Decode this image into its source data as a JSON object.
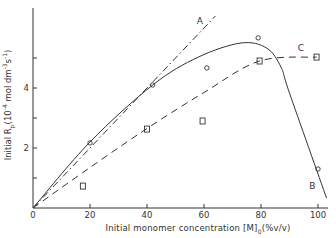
{
  "chart_data": {
    "type": "scatter",
    "title": "",
    "xlabel": "Initial monomer concentration [M]0(%v/v)",
    "ylabel": "Initial Rp(10^-4 mol dm^-3 s^-1)",
    "xlim": [
      0,
      104
    ],
    "ylim": [
      0,
      6.7
    ],
    "x_ticks": [
      0,
      20,
      40,
      60,
      80,
      100
    ],
    "x_tick_labels": [
      "0",
      "20",
      "40",
      "60",
      "80",
      "100"
    ],
    "y_ticks": [
      0,
      1,
      2,
      3,
      4,
      5
    ],
    "y_tick_labels": [
      "",
      "",
      "2",
      "",
      "4",
      ""
    ],
    "origin_label": "0",
    "grid": false,
    "legend": "none (curves labelled A, B, C inline)",
    "series": [
      {
        "name": "circles (experimental)",
        "marker": "circle",
        "x": [
          20,
          42,
          61,
          79,
          100
        ],
        "y": [
          2.17,
          4.1,
          4.67,
          5.67,
          1.3
        ]
      },
      {
        "name": "squares (experimental)",
        "marker": "square",
        "x": [
          17.5,
          40,
          59.5,
          79.5,
          99.5
        ],
        "y": [
          0.73,
          2.63,
          2.9,
          4.9,
          5.03
        ]
      },
      {
        "name": "A",
        "style": "dash-dot line",
        "x": [
          0,
          64
        ],
        "y": [
          0,
          6.4
        ]
      },
      {
        "name": "B",
        "style": "solid curve",
        "x": [
          0,
          20,
          42,
          58,
          73,
          82,
          87,
          90,
          103
        ],
        "y": [
          0,
          2.2,
          4.1,
          5.03,
          5.5,
          5.33,
          4.7,
          3.83,
          0.33
        ]
      },
      {
        "name": "C",
        "style": "dashed curve",
        "x": [
          0,
          20,
          40,
          60,
          79.5,
          99.5
        ],
        "y": [
          0,
          1.35,
          2.65,
          3.85,
          4.9,
          5.03
        ]
      }
    ],
    "annotations": [
      {
        "text": "A",
        "x": 58.5,
        "y": 6.23
      },
      {
        "text": "B",
        "x": 98,
        "y": 0.73
      },
      {
        "text": "C",
        "x": 94,
        "y": 5.33
      }
    ]
  },
  "labels": {
    "y_axis_prefix": "Initial R",
    "y_axis_sub": "p",
    "y_axis_mid1": "(10",
    "y_axis_exp1": "-4",
    "y_axis_mid2": " mol dm",
    "y_axis_exp2": "-3",
    "y_axis_mid3": "s",
    "y_axis_exp3": "-1",
    "y_axis_end": ")",
    "x_axis_prefix": "Initial  monomer  concentration [M]",
    "x_axis_sub": "0",
    "x_axis_end": "(%v/v)"
  }
}
